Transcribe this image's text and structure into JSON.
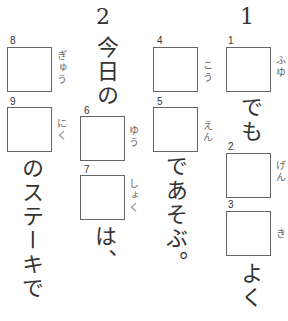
{
  "questions": [
    {
      "number": "1",
      "boxes": [
        {
          "label": "1",
          "reading": "ふゆ"
        },
        {
          "label": "2",
          "reading": "げん"
        },
        {
          "label": "3",
          "reading": "き"
        }
      ],
      "text_after_1": "でも",
      "text_after_3": "よく"
    },
    {
      "boxes": [
        {
          "label": "4",
          "reading": "こう"
        },
        {
          "label": "5",
          "reading": "えん"
        }
      ],
      "text_after_5": "であそぶ。"
    },
    {
      "number": "2",
      "text_before": "今日の",
      "boxes": [
        {
          "label": "6",
          "reading": "ゆう"
        },
        {
          "label": "7",
          "reading": "しょく"
        }
      ],
      "text_after_7": "は、"
    },
    {
      "boxes": [
        {
          "label": "8",
          "reading": "ぎゅう"
        },
        {
          "label": "9",
          "reading": "にく"
        }
      ],
      "text_after_9": "のステーキで"
    }
  ]
}
